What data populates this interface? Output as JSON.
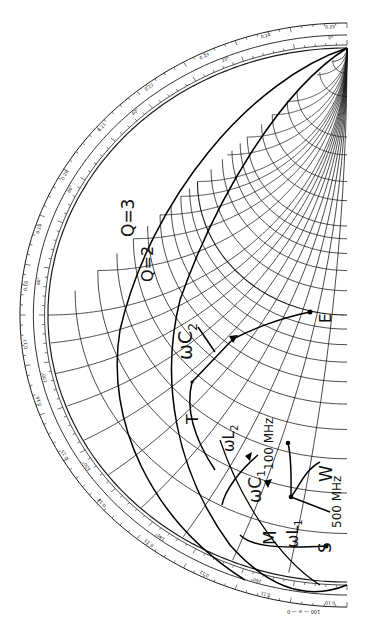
{
  "chart_data": {
    "type": "smith_chart",
    "title": "",
    "orientation": "rotated 90 degrees (real axis vertical on right edge, chart cropped to left half)",
    "colors": {
      "ink": "#1a1a1a",
      "background": "#ffffff"
    },
    "center_px": [
      347,
      315
    ],
    "outer_scale_labels": {
      "wavelengths_toward_generator": [
        "0.25",
        "0.24",
        "0.23",
        "0.22",
        "0.21",
        "0.20",
        "0.19",
        "0.18",
        "0.17",
        "0.16",
        "0.15",
        "0.14",
        "0.13",
        "0.12",
        "0.11",
        "0.10"
      ],
      "angle_degrees": [
        "0°",
        "20°",
        "40°",
        "60°",
        "80°",
        "100°",
        "120°",
        "140°",
        "160°"
      ]
    },
    "q_circles": [
      {
        "label": "Q=3",
        "value": 3
      },
      {
        "label": "Q=2",
        "value": 2
      }
    ],
    "points": [
      {
        "label": "E",
        "px": [
          310,
          312
        ]
      },
      {
        "label": "T",
        "px": [
          192,
          382
        ]
      },
      {
        "label": "W",
        "px": [
          291,
          470
        ]
      },
      {
        "label": "M",
        "px": [
          263,
          540
        ]
      },
      {
        "label": "S",
        "px": [
          326,
          546
        ]
      },
      {
        "label": "100 MHz",
        "px": [
          288,
          443
        ]
      },
      {
        "label": "500 MHz",
        "px": [
          330,
          520
        ]
      }
    ],
    "element_labels": [
      "ωC2",
      "ωL2",
      "ωC1",
      "ωL1"
    ],
    "bottom_scale_text": "100 — ∞ — 0"
  },
  "annotations": {
    "q3": "Q=3",
    "q2": "Q=2",
    "wc2": "ωC",
    "wc2_sub": "2",
    "wl2": "ωL",
    "wl2_sub": "2",
    "wc1": "ωC",
    "wc1_sub": "1",
    "wl1": "ωL",
    "wl1_sub": "1",
    "t": "T",
    "e": "E",
    "w": "W",
    "m": "M",
    "s": "S",
    "mhz100": "100 MHz",
    "mhz500": "500 MHz",
    "bottom_scale": "100 — ∞ — 0"
  },
  "scale": {
    "outer": [
      "0.25",
      "0.24",
      "0.23",
      "0.22",
      "0.21",
      "0.20",
      "0.19",
      "0.18",
      "0.17",
      "0.16",
      "0.15",
      "0.14",
      "0.13",
      "0.12",
      "0.11",
      "0.10"
    ],
    "angles": [
      "0°",
      "20°",
      "40°",
      "60°",
      "80°",
      "100°",
      "120°",
      "140°",
      "160°"
    ]
  }
}
